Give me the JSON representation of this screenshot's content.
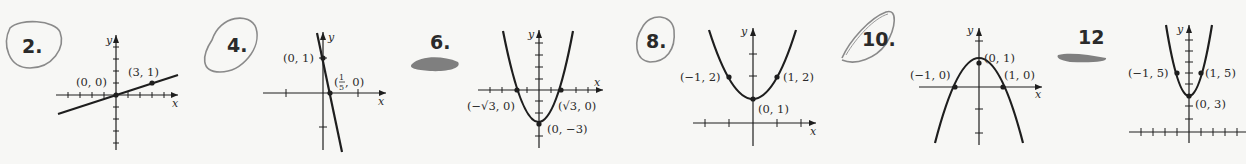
{
  "problems": [
    {
      "number": "2.",
      "mark": "circled",
      "equation_graph": "line through (0,0) and (3,1)",
      "points": [
        {
          "label": "(0, 0)"
        },
        {
          "label": "(3, 1)"
        }
      ],
      "axis_x": "x",
      "axis_y": "y"
    },
    {
      "number": "4.",
      "mark": "circled",
      "equation_graph": "line through (0,1) and (1/5,0)",
      "points": [
        {
          "label": "(0, 1)"
        },
        {
          "label_pre": "(",
          "frac_num": "1",
          "frac_den": "5",
          "label_post": ", 0)"
        }
      ],
      "axis_x": "x",
      "axis_y": "y"
    },
    {
      "number": "6.",
      "mark": "scribbled",
      "equation_graph": "parabola vertex (0,-3), x-intercepts ±√3",
      "points": [
        {
          "label": "(−√3, 0)"
        },
        {
          "label": "(√3, 0)"
        },
        {
          "label": "(0, −3)"
        }
      ],
      "axis_x": "x",
      "axis_y": "y"
    },
    {
      "number": "8.",
      "mark": "circled",
      "equation_graph": "parabola vertex (0,1)",
      "points": [
        {
          "label": "(−1, 2)"
        },
        {
          "label": "(1, 2)"
        },
        {
          "label": "(0, 1)"
        }
      ],
      "axis_x": "x",
      "axis_y": "y"
    },
    {
      "number": "10.",
      "mark": "circled",
      "equation_graph": "downward parabola vertex (0,1)",
      "points": [
        {
          "label": "(0, 1)"
        },
        {
          "label": "(−1, 0)"
        },
        {
          "label": "(1, 0)"
        }
      ],
      "axis_x": "x",
      "axis_y": "y"
    },
    {
      "number": "12",
      "mark": "scribbled",
      "equation_graph": "parabola vertex (0,3)",
      "points": [
        {
          "label": "(−1, 5)"
        },
        {
          "label": "(1, 5)"
        },
        {
          "label": "(0, 3)"
        }
      ],
      "axis_x": "x",
      "axis_y": "y"
    }
  ],
  "colors": {
    "ink": "#1e1e1e",
    "pencil": "#8a8a8a",
    "paper": "#f7f7f5"
  }
}
